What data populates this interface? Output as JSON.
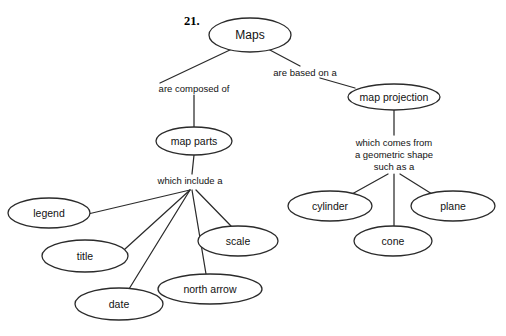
{
  "figure": {
    "number_label": "21.",
    "root": {
      "id": "maps",
      "label": "Maps",
      "cx": 250,
      "cy": 35,
      "rx": 41,
      "ry": 17
    },
    "nodes": [
      {
        "id": "map-parts",
        "label": "map parts",
        "cx": 194,
        "cy": 141,
        "rx": 38,
        "ry": 14
      },
      {
        "id": "map-projection",
        "label": "map projection",
        "cx": 394,
        "cy": 97,
        "rx": 46,
        "ry": 13
      },
      {
        "id": "legend",
        "label": "legend",
        "cx": 49,
        "cy": 213,
        "rx": 41,
        "ry": 15
      },
      {
        "id": "title",
        "label": "title",
        "cx": 85,
        "cy": 256,
        "rx": 43,
        "ry": 16
      },
      {
        "id": "date",
        "label": "date",
        "cx": 119,
        "cy": 304,
        "rx": 44,
        "ry": 16
      },
      {
        "id": "north-arrow",
        "label": "north arrow",
        "cx": 210,
        "cy": 289,
        "rx": 52,
        "ry": 15
      },
      {
        "id": "scale",
        "label": "scale",
        "cx": 238,
        "cy": 241,
        "rx": 40,
        "ry": 15
      },
      {
        "id": "cylinder",
        "label": "cylinder",
        "cx": 330,
        "cy": 206,
        "rx": 42,
        "ry": 15
      },
      {
        "id": "cone",
        "label": "cone",
        "cx": 393,
        "cy": 241,
        "rx": 39,
        "ry": 15
      },
      {
        "id": "plane",
        "label": "plane",
        "cx": 453,
        "cy": 206,
        "rx": 42,
        "ry": 15
      }
    ],
    "link_labels": [
      {
        "id": "are-composed-of",
        "text": "are composed of",
        "x": 194,
        "y": 89
      },
      {
        "id": "are-based-on-a",
        "text": "are based on a",
        "x": 305,
        "y": 73
      },
      {
        "id": "which-include-a",
        "text": "which include a",
        "x": 190,
        "y": 181
      },
      {
        "id": "geometric-shape-line-1",
        "text": "which comes from",
        "x": 394,
        "y": 143
      },
      {
        "id": "geometric-shape-line-2",
        "text": "a geometric shape",
        "x": 394,
        "y": 155
      },
      {
        "id": "geometric-shape-line-3",
        "text": "such as a",
        "x": 394,
        "y": 167
      }
    ],
    "edges": [
      {
        "id": "maps-to-composed-of",
        "d": "M 232 49 L 160 83"
      },
      {
        "id": "composed-of-to-map-parts",
        "d": "M 194 95 L 194 127"
      },
      {
        "id": "maps-to-based-on-a",
        "d": "M 268 49 L 300 66"
      },
      {
        "id": "based-on-a-to-projection",
        "d": "M 320 78 L 355 88"
      },
      {
        "id": "map-parts-to-include",
        "d": "M 194 155 L 192 174"
      },
      {
        "id": "include-to-legend",
        "d": "M 190 190 L 88 214"
      },
      {
        "id": "include-to-title",
        "d": "M 190 190 L 125 249"
      },
      {
        "id": "include-to-date",
        "d": "M 190 190 L 129 289"
      },
      {
        "id": "include-to-north-arrow",
        "d": "M 192 190 L 206 274"
      },
      {
        "id": "include-to-scale",
        "d": "M 196 190 L 231 226"
      },
      {
        "id": "projection-to-comes-from",
        "d": "M 394 110 L 394 135"
      },
      {
        "id": "shape-to-cylinder",
        "d": "M 388 174 L 352 194"
      },
      {
        "id": "shape-to-cone",
        "d": "M 394 174 L 394 226"
      },
      {
        "id": "shape-to-plane",
        "d": "M 400 174 L 432 194"
      }
    ]
  }
}
